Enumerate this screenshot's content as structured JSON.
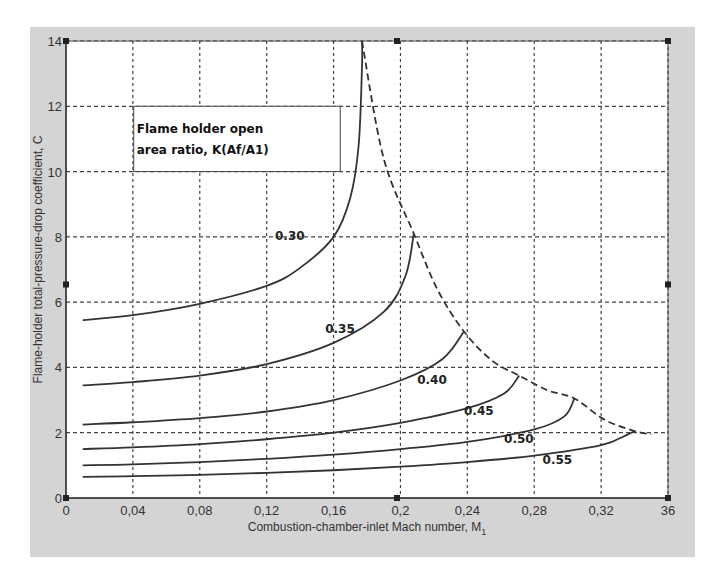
{
  "chart_data": {
    "type": "line",
    "title": "",
    "xlabel": "Combustion-chamber-inlet Mach number, M",
    "xlabel_subscript": "1",
    "ylabel": "Flame-holder total-pressure-drop coefficient, C",
    "xlim": [
      0,
      0.36
    ],
    "ylim": [
      0,
      14
    ],
    "grid": true,
    "x_ticks": [
      0,
      0.04,
      0.08,
      0.12,
      0.16,
      0.2,
      0.24,
      0.28,
      0.32,
      0.36
    ],
    "x_tick_labels": [
      "0",
      "0,04",
      "0,08",
      "0,12",
      "0,16",
      "0,2",
      "0,24",
      "0,28",
      "0,32",
      "36"
    ],
    "y_ticks": [
      0,
      2,
      4,
      6,
      8,
      10,
      12,
      14
    ],
    "y_tick_labels": [
      "0",
      "2",
      "4",
      "6",
      "8",
      "10",
      "12",
      "14"
    ],
    "legend_box": {
      "line1": "Flame holder open",
      "line2": "area ratio, K(Af/A1)",
      "position": "upper-left"
    },
    "series": [
      {
        "name": "0.30",
        "label_at": [
          0.125,
          7.9
        ],
        "points": [
          [
            0.01,
            5.45
          ],
          [
            0.04,
            5.6
          ],
          [
            0.08,
            5.95
          ],
          [
            0.12,
            6.5
          ],
          [
            0.14,
            7.05
          ],
          [
            0.16,
            8.0
          ],
          [
            0.17,
            9.2
          ],
          [
            0.175,
            10.8
          ],
          [
            0.177,
            13.2
          ],
          [
            0.177,
            14.0
          ]
        ]
      },
      {
        "name": "0.35",
        "label_at": [
          0.155,
          5.05
        ],
        "points": [
          [
            0.01,
            3.45
          ],
          [
            0.04,
            3.55
          ],
          [
            0.08,
            3.75
          ],
          [
            0.12,
            4.1
          ],
          [
            0.16,
            4.75
          ],
          [
            0.19,
            5.7
          ],
          [
            0.203,
            6.8
          ],
          [
            0.208,
            8.1
          ]
        ]
      },
      {
        "name": "0.40",
        "label_at": [
          0.21,
          3.5
        ],
        "points": [
          [
            0.01,
            2.25
          ],
          [
            0.04,
            2.32
          ],
          [
            0.08,
            2.45
          ],
          [
            0.12,
            2.65
          ],
          [
            0.16,
            3.0
          ],
          [
            0.2,
            3.6
          ],
          [
            0.225,
            4.25
          ],
          [
            0.238,
            5.1
          ]
        ]
      },
      {
        "name": "0.45",
        "label_at": [
          0.238,
          2.55
        ],
        "points": [
          [
            0.01,
            1.5
          ],
          [
            0.04,
            1.55
          ],
          [
            0.08,
            1.65
          ],
          [
            0.12,
            1.8
          ],
          [
            0.16,
            2.0
          ],
          [
            0.2,
            2.3
          ],
          [
            0.24,
            2.75
          ],
          [
            0.262,
            3.2
          ],
          [
            0.271,
            3.75
          ]
        ]
      },
      {
        "name": "0.50",
        "label_at": [
          0.262,
          1.7
        ],
        "points": [
          [
            0.01,
            1.0
          ],
          [
            0.04,
            1.03
          ],
          [
            0.08,
            1.1
          ],
          [
            0.12,
            1.2
          ],
          [
            0.16,
            1.33
          ],
          [
            0.2,
            1.5
          ],
          [
            0.24,
            1.72
          ],
          [
            0.28,
            2.1
          ],
          [
            0.298,
            2.5
          ],
          [
            0.304,
            3.05
          ]
        ]
      },
      {
        "name": "0.55",
        "label_at": [
          0.285,
          1.05
        ],
        "points": [
          [
            0.01,
            0.65
          ],
          [
            0.04,
            0.67
          ],
          [
            0.08,
            0.71
          ],
          [
            0.12,
            0.77
          ],
          [
            0.16,
            0.85
          ],
          [
            0.2,
            0.96
          ],
          [
            0.24,
            1.1
          ],
          [
            0.28,
            1.3
          ],
          [
            0.32,
            1.62
          ],
          [
            0.336,
            1.95
          ],
          [
            0.34,
            2.05
          ]
        ]
      }
    ],
    "envelope": {
      "name": "choking limit (dashed)",
      "style": "dashed",
      "points": [
        [
          0.177,
          14.0
        ],
        [
          0.19,
          10.4
        ],
        [
          0.208,
          8.1
        ],
        [
          0.222,
          6.4
        ],
        [
          0.238,
          5.1
        ],
        [
          0.255,
          4.2
        ],
        [
          0.271,
          3.75
        ],
        [
          0.288,
          3.3
        ],
        [
          0.304,
          3.05
        ],
        [
          0.322,
          2.4
        ],
        [
          0.34,
          2.05
        ],
        [
          0.35,
          1.95
        ]
      ]
    }
  },
  "colors": {
    "frame_bg": "#d4d4d4",
    "plot_bg": "#ffffff",
    "curve": "#333333",
    "grid": "#555555"
  }
}
